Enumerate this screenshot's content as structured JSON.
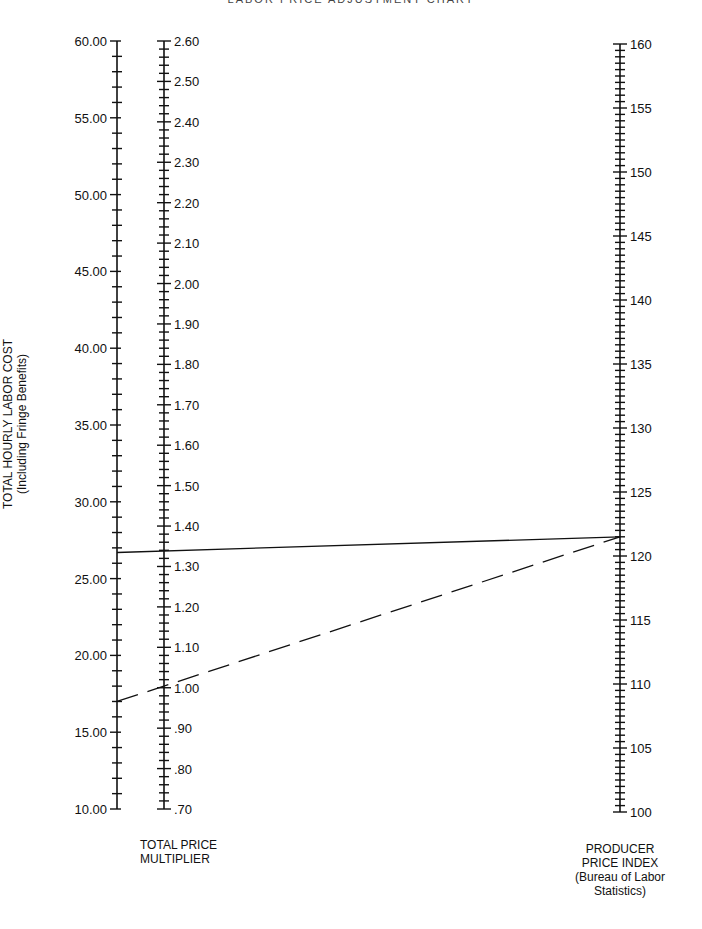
{
  "title": "LABOR PRICE ADJUSTMENT CHART",
  "chart_data": {
    "type": "nomogram",
    "title": "LABOR PRICE ADJUSTMENT CHART",
    "axes": [
      {
        "id": "labor_cost",
        "label_line1": "TOTAL HOURLY LABOR COST",
        "label_line2": "(Including Fringe Benefits)",
        "min": 10,
        "max": 60,
        "major_step": 5,
        "minor_step": 1,
        "tick_labels": [
          "10.00",
          "15.00",
          "20.00",
          "25.00",
          "30.00",
          "35.00",
          "40.00",
          "45.00",
          "50.00",
          "55.00",
          "60.00"
        ],
        "label_side": "left"
      },
      {
        "id": "price_multiplier",
        "label_line1": "TOTAL PRICE",
        "label_line2": "MULTIPLIER",
        "min": 0.7,
        "max": 2.6,
        "major_step": 0.1,
        "minor_step": 0.02,
        "tick_labels": [
          ".70",
          ".80",
          ".90",
          "1.00",
          "1.10",
          "1.20",
          "1.30",
          "1.40",
          "1.50",
          "1.60",
          "1.70",
          "1.80",
          "1.90",
          "2.00",
          "2.10",
          "2.20",
          "2.30",
          "2.40",
          "2.50",
          "2.60"
        ],
        "label_side": "right"
      },
      {
        "id": "ppi",
        "label_line1": "PRODUCER",
        "label_line2": "PRICE INDEX",
        "label_line3": "(Bureau of Labor",
        "label_line4": "Statistics)",
        "min": 100,
        "max": 160,
        "major_step": 5,
        "minor_step": 0.5,
        "tick_labels": [
          "100",
          "105",
          "110",
          "115",
          "120",
          "125",
          "130",
          "135",
          "140",
          "145",
          "150",
          "155",
          "160"
        ],
        "label_side": "right"
      }
    ],
    "lines": [
      {
        "style": "solid",
        "labor_cost": 26.7,
        "price_multiplier": 1.35,
        "ppi": 121.5
      },
      {
        "style": "dashed",
        "labor_cost": 17.0,
        "price_multiplier": 1.0,
        "ppi": 121.5
      }
    ]
  }
}
